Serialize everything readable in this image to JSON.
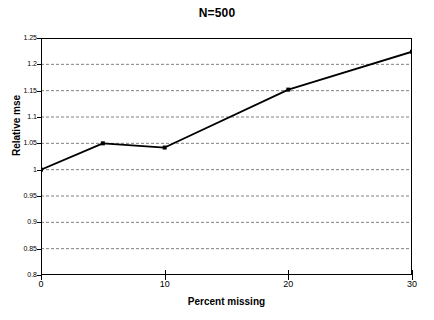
{
  "chart_data": {
    "type": "line",
    "title": "N=500",
    "xlabel": "Percent missing",
    "ylabel": "Relative mse",
    "x": [
      0,
      5,
      10,
      20,
      30
    ],
    "values": [
      1.0,
      1.05,
      1.042,
      1.152,
      1.224
    ],
    "series": [
      {
        "name": "Relative mse",
        "x": [
          0,
          5,
          10,
          20,
          30
        ],
        "values": [
          1.0,
          1.05,
          1.042,
          1.152,
          1.224
        ]
      }
    ],
    "xlim": [
      0,
      30
    ],
    "ylim": [
      0.8,
      1.25
    ],
    "x_ticks": [
      0,
      10,
      20,
      30
    ],
    "x_tick_labels": [
      "0",
      "10",
      "20",
      "30"
    ],
    "y_ticks": [
      0.8,
      0.85,
      0.9,
      0.95,
      1.0,
      1.05,
      1.1,
      1.15,
      1.2,
      1.25
    ],
    "y_tick_labels": [
      "0.8",
      "0.85",
      "0.9",
      "0.95",
      "1",
      "1.05",
      "1.1",
      "1.15",
      "1.2",
      "1.25"
    ],
    "grid": {
      "horizontal": true,
      "vertical": false,
      "style": "dashed",
      "color": "#808080"
    },
    "legend": null,
    "marker": "square",
    "line_color": "#000000",
    "marker_color": "#000000",
    "background_color": "#ffffff",
    "frame_color": "#000000"
  }
}
